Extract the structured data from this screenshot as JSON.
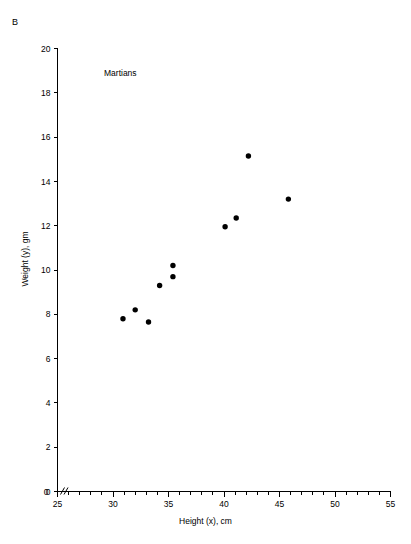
{
  "figure": {
    "panel_label": "B",
    "background_color": "#ffffff",
    "foreground_color": "#000000"
  },
  "chart_data": {
    "type": "scatter",
    "title": "",
    "annotation": "Martians",
    "xlabel": "Height (x), cm",
    "ylabel": "Weight (y), gm",
    "xlim": [
      25,
      55
    ],
    "ylim": [
      0,
      20
    ],
    "x_major_ticks": [
      25,
      30,
      35,
      40,
      45,
      50,
      55
    ],
    "x_major_tick_labels": [
      "25",
      "30",
      "35",
      "40",
      "45",
      "50",
      "55"
    ],
    "x_minor_tick_step": 1,
    "y_major_ticks": [
      0,
      2,
      4,
      6,
      8,
      10,
      12,
      14,
      16,
      18,
      20
    ],
    "y_major_tick_labels": [
      "0",
      "2",
      "4",
      "6",
      "8",
      "10",
      "12",
      "14",
      "16",
      "18",
      "20"
    ],
    "y_minor_ticks": [],
    "grid": false,
    "legend": false,
    "axis_break_x": true,
    "marker": "filled-circle",
    "marker_color": "#000000",
    "marker_size_px": 4.2,
    "points": [
      {
        "x": 30.9,
        "y": 7.8
      },
      {
        "x": 32.0,
        "y": 8.2
      },
      {
        "x": 33.2,
        "y": 7.65
      },
      {
        "x": 34.2,
        "y": 9.3
      },
      {
        "x": 35.4,
        "y": 10.2
      },
      {
        "x": 35.4,
        "y": 9.7
      },
      {
        "x": 40.1,
        "y": 11.95
      },
      {
        "x": 41.1,
        "y": 12.35
      },
      {
        "x": 42.2,
        "y": 15.15
      },
      {
        "x": 45.8,
        "y": 13.2
      }
    ]
  }
}
